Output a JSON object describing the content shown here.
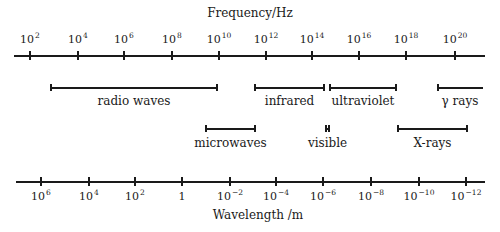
{
  "chart_data": {
    "type": "diagram",
    "frequency_axis": {
      "title": "Frequency/Hz",
      "position": "top",
      "ticks": [
        {
          "base": "10",
          "exp": "2",
          "x": 30
        },
        {
          "base": "10",
          "exp": "4",
          "x": 78
        },
        {
          "base": "10",
          "exp": "6",
          "x": 124
        },
        {
          "base": "10",
          "exp": "8",
          "x": 172
        },
        {
          "base": "10",
          "exp": "10",
          "x": 219
        },
        {
          "base": "10",
          "exp": "12",
          "x": 266
        },
        {
          "base": "10",
          "exp": "14",
          "x": 312
        },
        {
          "base": "10",
          "exp": "16",
          "x": 359
        },
        {
          "base": "10",
          "exp": "18",
          "x": 406
        },
        {
          "base": "10",
          "exp": "20",
          "x": 455
        }
      ]
    },
    "wavelength_axis": {
      "title": "Wavelength /m",
      "position": "bottom",
      "ticks": [
        {
          "base": "10",
          "exp": "6",
          "x": 41
        },
        {
          "base": "10",
          "exp": "4",
          "x": 89
        },
        {
          "base": "10",
          "exp": "2",
          "x": 135
        },
        {
          "base": "1",
          "exp": "",
          "x": 182
        },
        {
          "base": "10",
          "exp": "−2",
          "x": 230
        },
        {
          "base": "10",
          "exp": "−4",
          "x": 276
        },
        {
          "base": "10",
          "exp": "−6",
          "x": 323
        },
        {
          "base": "10",
          "exp": "−8",
          "x": 371
        },
        {
          "base": "10",
          "exp": "−10",
          "x": 419
        },
        {
          "base": "10",
          "exp": "−12",
          "x": 466
        }
      ]
    },
    "bands": [
      {
        "name": "radio waves",
        "row": 1,
        "x1": 50,
        "x2": 218,
        "freq_range_log10": [
          2.8,
          10
        ],
        "right_cap": true
      },
      {
        "name": "infrared",
        "row": 1,
        "x1": 254,
        "x2": 325,
        "freq_range_log10": [
          11.5,
          14.5
        ],
        "right_cap": true
      },
      {
        "name": "ultraviolet",
        "row": 1,
        "x1": 329,
        "x2": 397,
        "freq_range_log10": [
          14.8,
          17.6
        ],
        "right_cap": true
      },
      {
        "name": "γ rays",
        "row": 1,
        "x1": 437,
        "x2": 483,
        "freq_range_log10": [
          19.2,
          21
        ],
        "right_cap": false
      },
      {
        "name": "microwaves",
        "row": 2,
        "x1": 205,
        "x2": 256,
        "freq_range_log10": [
          9.4,
          11.6
        ],
        "right_cap": true
      },
      {
        "name": "visible",
        "row": 2,
        "x1": 325,
        "x2": 330,
        "freq_range_log10": [
          14.6,
          14.9
        ],
        "right_cap": true
      },
      {
        "name": "X-rays",
        "row": 2,
        "x1": 397,
        "x2": 468,
        "freq_range_log10": [
          17.6,
          20.6
        ],
        "right_cap": true
      }
    ]
  }
}
